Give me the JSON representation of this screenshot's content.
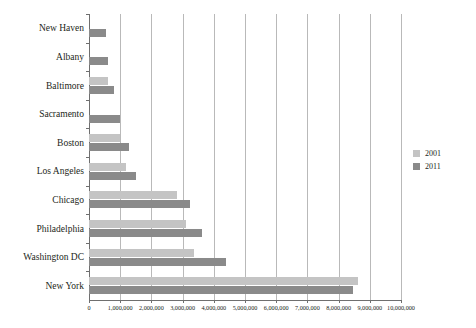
{
  "chart_data": {
    "type": "bar",
    "orientation": "horizontal",
    "title": "",
    "subtitle": "",
    "xlabel": "",
    "ylabel": "",
    "xlim": [
      0,
      10000000
    ],
    "xtick_step": 1000000,
    "grid": true,
    "legend_position": "right",
    "categories": [
      "New Haven",
      "Albany",
      "Baltimore",
      "Sacramento",
      "Boston",
      "Los Angeles",
      "Chicago",
      "Philadelphia",
      "Washington DC",
      "New York"
    ],
    "series": [
      {
        "name": "2001",
        "color": "#c4c4c4",
        "values": [
          0,
          0,
          620000,
          0,
          1000000,
          1180000,
          2830000,
          3120000,
          3370000,
          8620000
        ]
      },
      {
        "name": "2011",
        "color": "#8a8a8a",
        "values": [
          540000,
          600000,
          790000,
          980000,
          1270000,
          1520000,
          3230000,
          3630000,
          4390000,
          8470000
        ]
      }
    ],
    "xticklabels": [
      "0",
      "1,000,000",
      "2,000,000",
      "3,000,000",
      "4,000,000",
      "5,000,000",
      "6,000,000",
      "7,000,000",
      "8,000,000",
      "9,000,000",
      "10,000,000"
    ],
    "legend": [
      {
        "label": "2001",
        "color": "#c4c4c4"
      },
      {
        "label": "2011",
        "color": "#8a8a8a"
      }
    ]
  }
}
